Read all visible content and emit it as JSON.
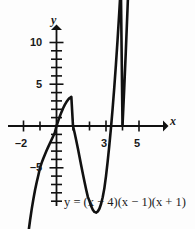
{
  "chart_data": {
    "type": "line",
    "title": "",
    "equation": "y = (x − 4)(x − 1)(x + 1)",
    "function": "cubic",
    "xlabel": "x",
    "ylabel": "y",
    "xlim": [
      -2.6,
      6.0
    ],
    "ylim": [
      -11.0,
      12.0
    ],
    "grid": false,
    "legend": "none",
    "x_tick_labels": [
      "–2",
      "3",
      "5"
    ],
    "x_tick_values": [
      -2,
      3,
      5
    ],
    "x_minor_ticks": [
      -1,
      1,
      2,
      4
    ],
    "y_tick_labels": [
      "10",
      "5",
      "–5"
    ],
    "y_tick_values": [
      10,
      5,
      -5
    ],
    "y_minor_ticks": [
      1,
      2,
      3,
      4,
      6,
      7,
      8,
      9,
      -1,
      -2,
      -3,
      -4,
      -6,
      -7,
      -8,
      -9
    ],
    "roots": [
      -1,
      1,
      4
    ],
    "local_max": {
      "x": -0.22,
      "y": 4.06
    },
    "local_min": {
      "x": 2.55,
      "y": -8.21
    },
    "y_intercept": 4,
    "curve_color": "#111111",
    "axis_color": "#111111",
    "background_color": "#fdfdfd",
    "series": [
      {
        "name": "y = (x − 4)(x − 1)(x + 1)",
        "x": [
          -2.1,
          -2.0,
          -1.9,
          -1.8,
          -1.7,
          -1.6,
          -1.5,
          -1.4,
          -1.3,
          -1.2,
          -1.1,
          -1.0,
          -0.9,
          -0.8,
          -0.7,
          -0.6,
          -0.5,
          -0.4,
          -0.3,
          -0.2,
          -0.1,
          0.0,
          0.1,
          0.2,
          0.3,
          0.4,
          0.5,
          0.6,
          0.7,
          0.8,
          0.9,
          1.0,
          1.1,
          1.2,
          1.3,
          1.4,
          1.5,
          1.6,
          1.7,
          1.8,
          1.9,
          2.0,
          2.1,
          2.2,
          2.3,
          2.4,
          2.5,
          2.6,
          2.7,
          2.8,
          2.9,
          3.0,
          3.1,
          3.2,
          3.3,
          3.4,
          3.5,
          3.6,
          3.7,
          3.8,
          3.9,
          4.0,
          4.1,
          4.2,
          4.3,
          4.4,
          4.5,
          4.6,
          4.7
        ],
        "y": [
          -20.06,
          -18.0,
          -16.09,
          -14.34,
          -12.73,
          -11.26,
          -9.93,
          -8.74,
          -7.67,
          -6.73,
          -5.9,
          -5.0,
          -4.42,
          -3.89,
          -3.4,
          -2.94,
          -2.5,
          -2.07,
          -1.64,
          -1.22,
          -0.78,
          0.0,
          0.59,
          1.15,
          1.66,
          2.12,
          2.53,
          2.87,
          3.15,
          3.35,
          3.48,
          0.0,
          -0.84,
          -1.76,
          -2.73,
          -3.74,
          -4.75,
          -5.75,
          -6.72,
          -7.64,
          -8.49,
          -9.0,
          -9.59,
          -10.03,
          -10.29,
          -10.37,
          -10.24,
          -9.91,
          -9.34,
          -8.53,
          -7.47,
          -6.0,
          -4.27,
          -2.35,
          -0.25,
          2.06,
          4.57,
          7.31,
          10.28,
          13.49,
          16.95,
          0.0,
          4.3,
          8.9,
          13.8,
          19.01,
          24.54,
          30.4,
          36.59
        ]
      }
    ],
    "arrows": [
      {
        "name": "curve-arrow-bottom-left",
        "direction": "down-left"
      },
      {
        "name": "curve-arrow-top-right",
        "direction": "up-right"
      },
      {
        "name": "x-axis-arrow",
        "direction": "right"
      },
      {
        "name": "y-axis-arrow",
        "direction": "up"
      }
    ]
  },
  "labels": {
    "y_10": "10",
    "y_5": "5",
    "y_minus5": "–5",
    "x_minus2": "–2",
    "x_3": "3",
    "x_5": "5",
    "axis_y": "y",
    "axis_x": "x",
    "equation": "y = (x − 4)(x − 1)(x + 1)"
  }
}
